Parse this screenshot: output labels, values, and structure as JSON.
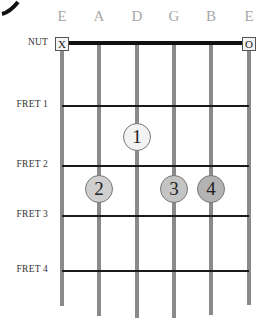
{
  "diagram": {
    "type": "guitar-chord-chart",
    "strings": [
      {
        "name": "E",
        "x": 62,
        "bottom": 306,
        "marker": "X"
      },
      {
        "name": "A",
        "x": 99,
        "bottom": 316,
        "marker": null
      },
      {
        "name": "D",
        "x": 137,
        "bottom": 318,
        "marker": null
      },
      {
        "name": "G",
        "x": 174,
        "bottom": 318,
        "marker": null
      },
      {
        "name": "B",
        "x": 211,
        "bottom": 315,
        "marker": null
      },
      {
        "name": "E",
        "x": 249,
        "bottom": 305,
        "marker": "O"
      }
    ],
    "nut_label": "NUT",
    "frets": [
      {
        "label": "FRET 1",
        "y": 106
      },
      {
        "label": "FRET 2",
        "y": 166
      },
      {
        "label": "FRET 3",
        "y": 216
      },
      {
        "label": "FRET 4",
        "y": 271
      }
    ],
    "fingers": [
      {
        "number": "1",
        "string": "D",
        "x": 137,
        "y": 137,
        "color": "#f2f2f2"
      },
      {
        "number": "2",
        "string": "A",
        "x": 99,
        "y": 189,
        "color": "#cfcfcf"
      },
      {
        "number": "3",
        "string": "G",
        "x": 174,
        "y": 189,
        "color": "#c4c4c4"
      },
      {
        "number": "4",
        "string": "B",
        "x": 211,
        "y": 189,
        "color": "#b3b3b3"
      }
    ],
    "colors": {
      "string": "#8a8a8a",
      "nut": "#111111",
      "fret": "#1a1a1a",
      "string_name": "#a8a8a8"
    }
  }
}
